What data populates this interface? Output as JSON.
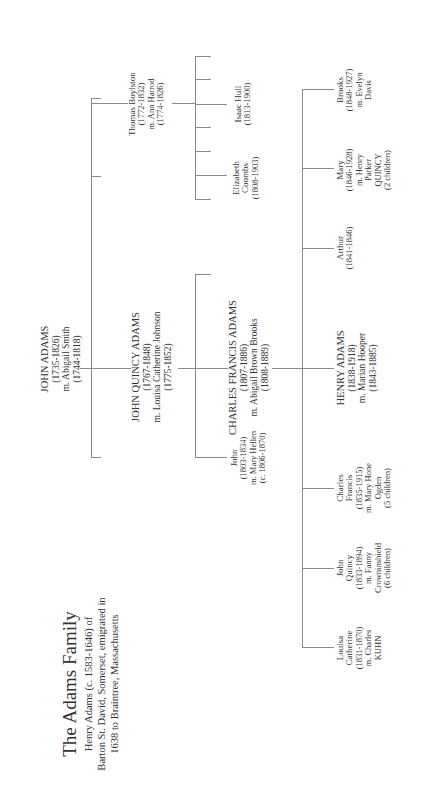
{
  "title": {
    "heading": "The Adams Family",
    "line1": "Henry Adams  (c. 1583-1646) of",
    "line2": "Barton St. David, Somerset, emigrated in",
    "line3": "1638 to Braintree, Massachusetts"
  },
  "gen1": {
    "john_adams": {
      "name": "JOHN ADAMS",
      "dates": "(1735-1826)",
      "spouse": "m. Abigail Smith",
      "spouse_dates": "(1744-1818)"
    }
  },
  "gen2": {
    "john_quincy_adams": {
      "name": "JOHN QUINCY ADAMS",
      "dates": "(1767-1848)",
      "spouse": "m. Louisa Catherine Johnson",
      "spouse_dates": "(1775-1852)"
    },
    "thomas_boylston": {
      "name": "Thomas Boylston",
      "dates": "(1772-1832)",
      "spouse": "m. Ann Harrod",
      "spouse_dates": "(1774-1826)"
    }
  },
  "gen3": {
    "charles_francis_adams": {
      "name": "CHARLES FRANCIS ADAMS",
      "dates": "(1807-1886)",
      "spouse": "m. Abigail Brown Brooks",
      "spouse_dates": "(1808-1889)"
    },
    "john": {
      "name": "John",
      "dates": "(1803-1834)",
      "spouse": "m. Mary Hellen",
      "spouse_dates": "(c. 1806-1870)"
    },
    "isaac_hull": {
      "name": "Isaac Hull",
      "dates": "(1813-1900)"
    },
    "elizabeth_coombs": {
      "line1": "Elizabeth",
      "line2": "Coombs",
      "dates": "(1808-1903)"
    }
  },
  "gen4": {
    "louisa_catherine": {
      "line1": "Louisa",
      "line2": "Catherine",
      "dates": "(1831-1870)",
      "spouse": "m. Charles",
      "spouse2": "KUHN"
    },
    "john_quincy": {
      "line1": "John",
      "line2": "Quincy",
      "dates": "(1833-1894)",
      "spouse": "m. Fanny",
      "spouse2": "Crowninshield",
      "children": "(6 children)"
    },
    "charles_francis": {
      "line1": "Charles",
      "line2": "Francis",
      "dates": "(1835-1915)",
      "spouse": "m. Mary Hone",
      "spouse2": "Ogden",
      "children": "(5 children)"
    },
    "henry_adams": {
      "name": "HENRY ADAMS",
      "dates": "(1838-1918)",
      "spouse": "m. Marian Hooper",
      "spouse_dates": "(1843-1885)"
    },
    "arthur": {
      "name": "Arthur",
      "dates": "(1841-1846)"
    },
    "mary": {
      "name": "Mary",
      "dates": "(1846-1928)",
      "spouse": "m. Henry",
      "spouse2": "Parker",
      "spouse3": "QUINCY",
      "children": "(2 children)"
    },
    "brooks": {
      "name": "Brooks",
      "dates": "(1848-1927)",
      "spouse": "m. Evelyn",
      "spouse2": "Davis"
    }
  }
}
